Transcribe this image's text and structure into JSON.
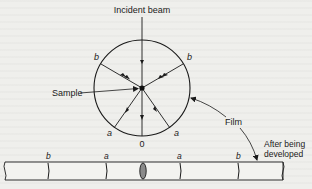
{
  "diagram": {
    "type": "x-ray powder diffraction (Debye-Scherrer camera) schematic",
    "labels": {
      "incident_beam": "Incident beam",
      "sample": "Sample",
      "film": "Film",
      "after_developed_line1": "After being",
      "after_developed_line2": "developed",
      "zero": "0"
    },
    "ray_labels": {
      "b_left": "b",
      "b_right": "b",
      "a_left": "a",
      "a_right": "a"
    },
    "film_strip_labels": [
      "b",
      "a",
      "a",
      "b"
    ],
    "colors": {
      "line": "#1a1a1a",
      "center_spot": "#8a8a8a",
      "background": "#efefec"
    }
  }
}
